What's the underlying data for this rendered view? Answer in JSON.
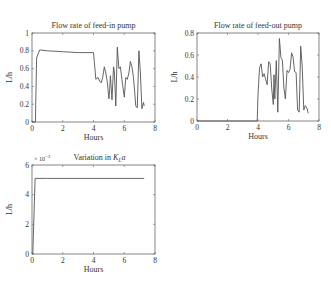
{
  "chart_data": [
    {
      "type": "line",
      "title": "Flow rate of feed-in pump",
      "xlabel": "Hours",
      "ylabel": "L/h",
      "xlim": [
        0,
        8
      ],
      "ylim": [
        0,
        1
      ],
      "xticks": [
        0,
        2,
        4,
        6,
        8
      ],
      "yticks": [
        0,
        0.2,
        0.4,
        0.6,
        0.8,
        1
      ],
      "ytick_labels": [
        "0",
        "0.2",
        "0.4",
        "0.6",
        "0.8",
        "1"
      ],
      "grid": false,
      "box": [
        32,
        33,
        155,
        122
      ],
      "x": [
        0,
        0.22,
        0.3,
        0.5,
        1,
        2,
        3,
        4,
        4.05,
        4.15,
        4.3,
        4.4,
        4.5,
        4.6,
        4.7,
        4.8,
        4.9,
        5.0,
        5.05,
        5.1,
        5.2,
        5.3,
        5.35,
        5.45,
        5.55,
        5.65,
        5.75,
        5.85,
        6.0,
        6.1,
        6.2,
        6.3,
        6.4,
        6.5,
        6.6,
        6.75,
        6.85,
        6.95,
        7.05,
        7.15,
        7.25,
        7.3
      ],
      "y": [
        0,
        0,
        0.72,
        0.81,
        0.8,
        0.79,
        0.78,
        0.78,
        0.68,
        0.48,
        0.5,
        0.46,
        0.44,
        0.5,
        0.62,
        0.55,
        0.45,
        0.26,
        0.35,
        0.52,
        0.25,
        0.62,
        0.58,
        0.18,
        0.84,
        0.6,
        0.62,
        0.48,
        0.28,
        0.5,
        0.48,
        0.55,
        0.68,
        0.62,
        0.5,
        0.18,
        0.16,
        0.8,
        0.55,
        0.15,
        0.22,
        0.18
      ],
      "series_color": "#555555"
    },
    {
      "type": "line",
      "title": "Flow rate of feed-out pump",
      "xlabel": "Hours",
      "ylabel": "L/h",
      "xlim": [
        0,
        8
      ],
      "ylim": [
        0,
        0.8
      ],
      "xticks": [
        0,
        2,
        4,
        6,
        8
      ],
      "yticks": [
        0,
        0.2,
        0.4,
        0.6,
        0.8
      ],
      "ytick_labels": [
        "0",
        "0.2",
        "0.4",
        "0.6",
        "0.8"
      ],
      "grid": false,
      "box": [
        197,
        33,
        319,
        121
      ],
      "x": [
        0,
        3.95,
        4.0,
        4.1,
        4.2,
        4.3,
        4.4,
        4.5,
        4.6,
        4.7,
        4.8,
        4.9,
        5.0,
        5.05,
        5.1,
        5.2,
        5.3,
        5.4,
        5.5,
        5.6,
        5.7,
        5.8,
        5.9,
        6.0,
        6.1,
        6.2,
        6.3,
        6.4,
        6.5,
        6.6,
        6.7,
        6.8,
        6.9,
        7.0,
        7.1,
        7.2,
        7.3
      ],
      "y": [
        0,
        0,
        0.24,
        0.48,
        0.52,
        0.4,
        0.43,
        0.38,
        0.33,
        0.54,
        0.52,
        0.3,
        0.15,
        0.42,
        0.2,
        0.55,
        0.08,
        0.75,
        0.58,
        0.55,
        0.3,
        0.2,
        0.46,
        0.44,
        0.47,
        0.62,
        0.58,
        0.45,
        0.44,
        0.1,
        0.08,
        0.68,
        0.5,
        0.1,
        0.14,
        0.12,
        0.07
      ],
      "series_color": "#555555"
    },
    {
      "type": "line",
      "title": "Variation in KLa",
      "title_main": "Variation in ",
      "title_var": "K",
      "title_sub": "L",
      "title_tail": "a",
      "xlabel": "Hours",
      "ylabel": "L/h",
      "xlim": [
        0,
        8
      ],
      "ylim": [
        0,
        6
      ],
      "y_multiplier": "× 10",
      "y_multiplier_exp": "−3",
      "xticks": [
        0,
        2,
        4,
        6,
        8
      ],
      "yticks": [
        0,
        2,
        4,
        6
      ],
      "ytick_labels": [
        "0",
        "2",
        "4",
        "6"
      ],
      "grid": false,
      "box": [
        32,
        165,
        155,
        254
      ],
      "x": [
        0,
        0.05,
        0.2,
        1,
        3,
        5,
        7.3
      ],
      "y": [
        0,
        0,
        5.1,
        5.1,
        5.1,
        5.1,
        5.1
      ],
      "series_color": "#555555"
    }
  ],
  "colors": {
    "axis": "#666666",
    "line": "#555555",
    "text": "#333333"
  }
}
